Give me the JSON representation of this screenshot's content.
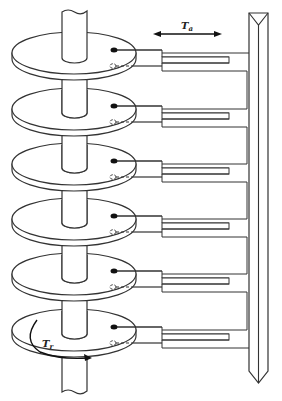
{
  "figure": {
    "stroke_color": "#333333",
    "background": "#ffffff"
  },
  "labels": {
    "actuator_motion": {
      "main": "T",
      "sub": "a"
    },
    "rotation": {
      "main": "T",
      "sub": "r"
    }
  },
  "platters": {
    "count": 6,
    "center_x": 74,
    "rx": 62,
    "ry": 21,
    "thickness": 6,
    "top_y": [
      53,
      109,
      164,
      219,
      274,
      330
    ]
  },
  "heads": {
    "per_platter": [
      "read-write-head-top (filled)",
      "read-write-head-bottom (open, dashed)"
    ]
  },
  "actuator": {
    "rail_x": [
      249,
      268
    ],
    "rail_top": 13,
    "rail_tip": 383
  }
}
